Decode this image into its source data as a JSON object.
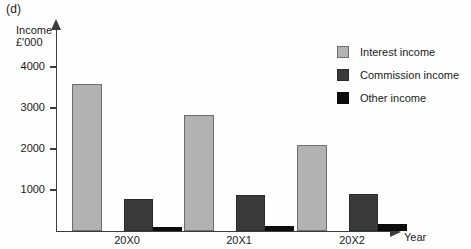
{
  "panel": {
    "label": "(d)"
  },
  "chart_data": {
    "type": "bar",
    "title": "(d)",
    "xlabel": "Year",
    "ylabel": "Income\n£'000",
    "ylabel_line1": "Income",
    "ylabel_line2": "£'000",
    "categories": [
      "20X0",
      "20X1",
      "20X2"
    ],
    "series": [
      {
        "name": "Interest income",
        "key": "interest",
        "color": "#b2b2b2",
        "values": [
          3580,
          2830,
          2100
        ]
      },
      {
        "name": "Commission income",
        "key": "commission",
        "color": "#3a3a3a",
        "values": [
          780,
          880,
          900
        ]
      },
      {
        "name": "Other income",
        "key": "other",
        "color": "#0d0d0d",
        "values": [
          100,
          110,
          170
        ]
      }
    ],
    "ylim": [
      0,
      4400
    ],
    "yticks": [
      1000,
      2000,
      3000,
      4000
    ],
    "ytick_labels": [
      "1000",
      "2000",
      "3000",
      "4000"
    ],
    "grid": false,
    "legend_position": "top-right"
  },
  "axis": {
    "y_title_line1": "Income",
    "y_title_line2": "£'000",
    "x_title": "Year"
  },
  "ticks": [
    {
      "value": 4000,
      "label": "4000"
    },
    {
      "value": 3000,
      "label": "3000"
    },
    {
      "value": 2000,
      "label": "2000"
    },
    {
      "value": 1000,
      "label": "1000"
    }
  ],
  "legend": {
    "items": [
      {
        "label": "Interest income",
        "key": "interest"
      },
      {
        "label": "Commission income",
        "key": "commission"
      },
      {
        "label": "Other income",
        "key": "other"
      }
    ]
  },
  "groups": [
    {
      "label": "20X0"
    },
    {
      "label": "20X1"
    },
    {
      "label": "20X2"
    }
  ]
}
